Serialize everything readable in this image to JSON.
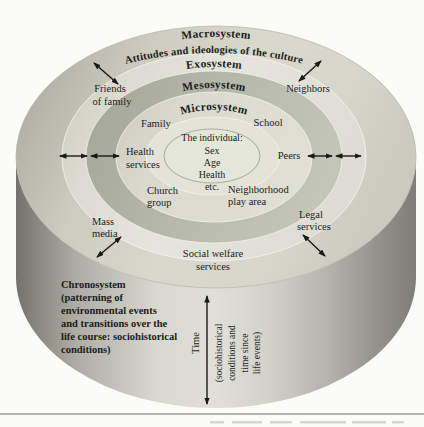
{
  "rings": {
    "macrosystem_label": "Macrosystem",
    "macrosystem_description": "Attitudes and ideologies of the culture",
    "exosystem_label": "Exosystem",
    "mesosystem_label": "Mesosystem",
    "microsystem_label": "Microsystem"
  },
  "individual": {
    "title": "The individual:",
    "attr1": "Sex",
    "attr2": "Age",
    "attr3": "Health",
    "attr4": "etc."
  },
  "microsystem_items": {
    "family": "Family",
    "school": "School",
    "health_line1": "Health",
    "health_line2": "services",
    "peers": "Peers",
    "church_line1": "Church",
    "church_line2": "group",
    "neighborhood_line1": "Neighborhood",
    "neighborhood_line2": "play area"
  },
  "exosystem_items": {
    "friends_line1": "Friends",
    "friends_line2": "of family",
    "neighbors": "Neighbors",
    "mass_line1": "Mass",
    "mass_line2": "media",
    "legal_line1": "Legal",
    "legal_line2": "services",
    "welfare_line1": "Social welfare",
    "welfare_line2": "services"
  },
  "chronosystem": {
    "line1": "Chronosystem",
    "line2": "(patterning of",
    "line3": "environmental events",
    "line4": "and transitions over the",
    "line5": "life course: sociohistorical",
    "line6": "conditions)"
  },
  "time_axis": {
    "label": "Time",
    "sub_line1": "(sociohistorical",
    "sub_line2": "conditions and",
    "sub_line3": "time since",
    "sub_line4": "life events)"
  },
  "colors": {
    "ink": "#1c1c1c",
    "band_dark": "#aeb1a1",
    "band_light": "#e4e3d9",
    "face_base": "#d3d2c6",
    "side_dark": "#7c7c74"
  }
}
